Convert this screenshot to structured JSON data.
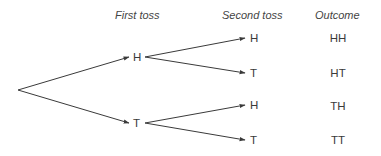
{
  "headers": {
    "first_toss": "First toss",
    "second_toss": "Second toss",
    "outcome": "Outcome"
  },
  "first_level": [
    {
      "label": "H"
    },
    {
      "label": "T"
    }
  ],
  "second_level": [
    {
      "parent": "H",
      "label": "H"
    },
    {
      "parent": "H",
      "label": "T"
    },
    {
      "parent": "T",
      "label": "H"
    },
    {
      "parent": "T",
      "label": "T"
    }
  ],
  "outcomes": [
    "HH",
    "HT",
    "TH",
    "TT"
  ],
  "colors": {
    "line": "#3a3a3a",
    "text": "#3a3a3a",
    "background": "#ffffff"
  }
}
